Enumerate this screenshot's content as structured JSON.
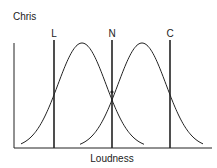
{
  "diagram": {
    "title": "Chris",
    "xlabel": "Loudness",
    "criteria": [
      {
        "label": "L",
        "x": 54
      },
      {
        "label": "N",
        "x": 112
      },
      {
        "label": "C",
        "x": 170
      }
    ],
    "distributions": [
      {
        "name": "left-distribution",
        "peak_x": 82
      },
      {
        "name": "right-distribution",
        "peak_x": 142
      }
    ],
    "colors": {
      "ink": "#222222",
      "background": "#ffffff"
    }
  }
}
